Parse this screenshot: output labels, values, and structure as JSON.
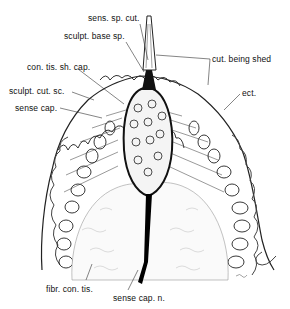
{
  "figure": {
    "labels": [
      {
        "id": "sens-sp-cut",
        "text": "sens. sp. cut.",
        "x": 88,
        "y": 19
      },
      {
        "id": "sculpt-base-sp",
        "text": "sculpt. base sp.",
        "x": 64,
        "y": 36
      },
      {
        "id": "cut-being-shed",
        "text": "cut. being shed",
        "x": 212,
        "y": 56
      },
      {
        "id": "con-tis-sh-cap",
        "text": "con. tis. sh. cap.",
        "x": 28,
        "y": 63
      },
      {
        "id": "sculpt-cut-sc",
        "text": "sculpt. cut. sc.",
        "x": 10,
        "y": 86
      },
      {
        "id": "ect",
        "text": "ect.",
        "x": 242,
        "y": 90
      },
      {
        "id": "sense-cap",
        "text": "sense cap.",
        "x": 15,
        "y": 103
      },
      {
        "id": "fibr-con-tis",
        "text": "fibr. con. tis.",
        "x": 46,
        "y": 284
      },
      {
        "id": "sense-cap-n",
        "text": "sense cap. n.",
        "x": 113,
        "y": 293
      }
    ]
  }
}
